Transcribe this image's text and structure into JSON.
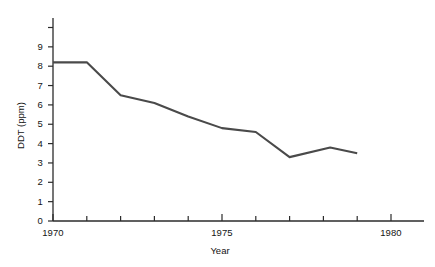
{
  "chart_data": {
    "type": "line",
    "title": "",
    "xlabel": "Year",
    "ylabel": "DDT (ppm)",
    "xlim": [
      1970,
      1980.8
    ],
    "ylim": [
      0,
      10.3
    ],
    "grid": false,
    "legend": null,
    "x_ticks": [
      1970,
      1971,
      1972,
      1973,
      1974,
      1975,
      1976,
      1977,
      1978,
      1979,
      1980
    ],
    "x_tick_labels": [
      "1970",
      "",
      "",
      "",
      "",
      "1975",
      "",
      "",
      "",
      "",
      "1980"
    ],
    "y_ticks": [
      0,
      1,
      2,
      3,
      4,
      5,
      6,
      7,
      8,
      9,
      10
    ],
    "y_tick_labels": [
      "0",
      "1",
      "2",
      "3",
      "4",
      "5",
      "6",
      "7",
      "8",
      "9",
      ""
    ],
    "series": [
      {
        "name": "DDT concentration",
        "color": "#4a4a4a",
        "x": [
          1970.0,
          1971.0,
          1972.0,
          1973.0,
          1974.0,
          1975.0,
          1976.0,
          1977.0,
          1978.2,
          1979.0
        ],
        "values": [
          8.2,
          8.2,
          6.5,
          6.1,
          5.4,
          4.8,
          4.6,
          3.3,
          3.8,
          3.5
        ]
      }
    ]
  },
  "axis": {
    "x_title": "Year",
    "y_title": "DDT (ppm)"
  },
  "y_labels": [
    {
      "value": "9",
      "y": 47
    },
    {
      "value": "8",
      "y": 66
    },
    {
      "value": "7",
      "y": 86
    },
    {
      "value": "6",
      "y": 105
    },
    {
      "value": "5",
      "y": 124
    },
    {
      "value": "4",
      "y": 144
    },
    {
      "value": "3",
      "y": 163
    },
    {
      "value": "2",
      "y": 182
    },
    {
      "value": "1",
      "y": 202
    },
    {
      "value": "0",
      "y": 221
    }
  ],
  "x_labels": [
    {
      "value": "1970",
      "x": 53
    },
    {
      "value": "1975",
      "x": 222
    },
    {
      "value": "1980",
      "x": 391
    }
  ]
}
